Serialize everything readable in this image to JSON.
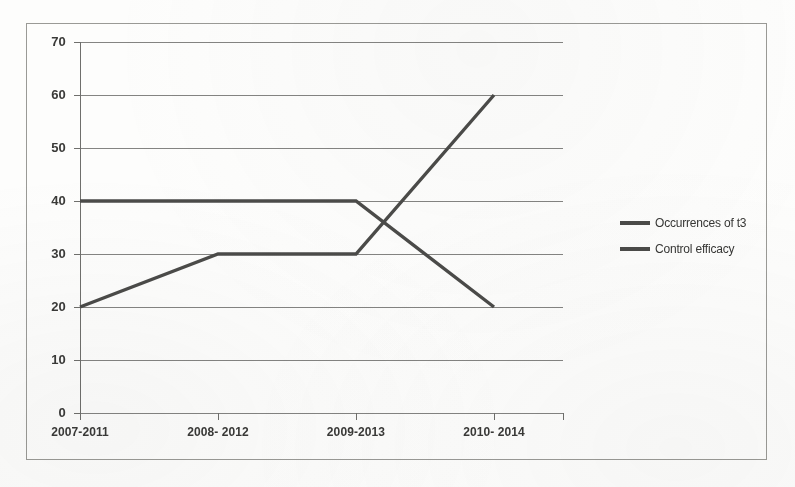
{
  "chart_data": {
    "type": "line",
    "title": "",
    "xlabel": "",
    "ylabel": "",
    "categories": [
      "2007-2011",
      "2008- 2012",
      "2009-2013",
      "2010- 2014"
    ],
    "series": [
      {
        "name": "Occurrences of t3",
        "values": [
          40,
          40,
          40,
          20
        ]
      },
      {
        "name": "Control efficacy",
        "values": [
          20,
          30,
          30,
          60
        ]
      }
    ],
    "ylim": [
      0,
      70
    ],
    "yticks": [
      0,
      10,
      20,
      30,
      40,
      50,
      60,
      70
    ],
    "ytick_labels": [
      "0",
      "10",
      "20",
      "30",
      "40",
      "50",
      "60",
      "70"
    ],
    "grid": true,
    "legend_position": "right",
    "line_color": "#4b4b49",
    "grid_color": "#6f6f6c",
    "border_color": "#9a9a96",
    "background": "#fdfdfc"
  },
  "legend": {
    "items": [
      {
        "label": "Occurrences of t3"
      },
      {
        "label": "Control efficacy"
      }
    ]
  }
}
